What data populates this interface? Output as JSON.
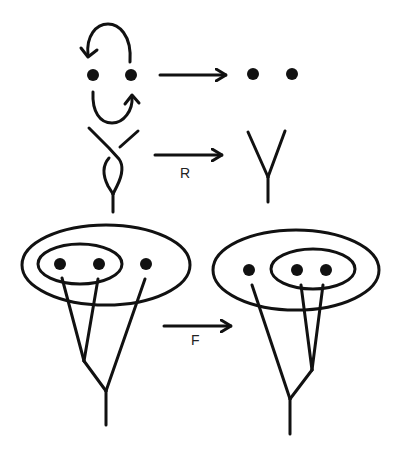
{
  "diagram": {
    "rows": [
      {
        "name": "swap-move",
        "left": "two points with clockwise exchange arrows",
        "right": "two points",
        "arrow_label": ""
      },
      {
        "name": "R-move",
        "left": "two strands crossing twice then merging into one (twisted Y)",
        "right": "untwisted Y",
        "arrow_label": "R"
      },
      {
        "name": "F-move",
        "left": "outer ellipse containing inner ellipse with 2 dots, plus 1 dot; tree merges inner pair first",
        "right": "outer ellipse containing 1 dot plus inner ellipse with 2 dots; tree merges inner pair first",
        "arrow_label": "F"
      }
    ],
    "colors": {
      "ink": "#111111",
      "background": "#ffffff"
    }
  }
}
